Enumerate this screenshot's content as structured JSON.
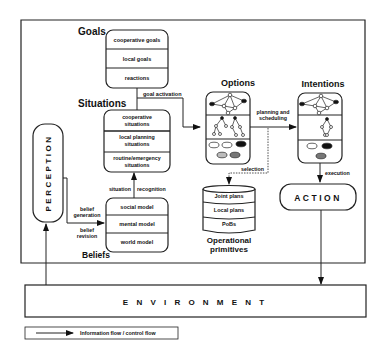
{
  "goals": {
    "title": "Goals",
    "items": [
      "cooperative goals",
      "local goals",
      "reactions"
    ]
  },
  "situations": {
    "title": "Situations",
    "items": [
      "cooperative",
      "situations",
      "local planning",
      "situations",
      "routine/emergency",
      "situations"
    ]
  },
  "beliefs": {
    "title": "Beliefs",
    "items": [
      "social model",
      "mental model",
      "world model"
    ]
  },
  "options": {
    "title": "Options"
  },
  "intentions": {
    "title": "Intentions"
  },
  "primitives": {
    "items": [
      "Joint plans",
      "Local plans",
      "PoBs"
    ],
    "title_line1": "Operational",
    "title_line2": "primitives"
  },
  "perception": {
    "label": "PERCEPTION"
  },
  "action": {
    "label": "ACTION"
  },
  "environment": {
    "label": "E N V I R O N M E N T"
  },
  "edges": {
    "goal_activation": "goal activation",
    "planning_1": "planning and",
    "planning_2": "scheduling",
    "selection": "selection",
    "execution": "execution",
    "situation": "situation",
    "recognition": "recognition",
    "belief_gen_1": "belief",
    "belief_gen_2": "generation",
    "belief_rev_1": "belief",
    "belief_rev_2": "revision"
  },
  "legend": {
    "label": "Information flow / control flow"
  }
}
